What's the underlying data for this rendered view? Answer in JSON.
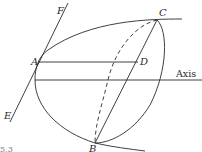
{
  "figure": {
    "caption_fragment": "5.3",
    "labels": {
      "A": "A",
      "B": "B",
      "C": "C",
      "D": "D",
      "E": "E",
      "F": "F",
      "axis": "Axis"
    },
    "elements": [
      {
        "id": "tangent-line",
        "from": "E",
        "to": "F"
      },
      {
        "id": "chord-AD",
        "from": "A",
        "to": "D"
      },
      {
        "id": "chord-BC",
        "from": "B",
        "to": "C"
      },
      {
        "id": "axis-line",
        "label": "Axis"
      },
      {
        "id": "parabola-curve",
        "through": [
          "C",
          "A",
          "B"
        ]
      },
      {
        "id": "ellipse-front",
        "style": "solid",
        "from": "C",
        "to": "B"
      },
      {
        "id": "ellipse-back",
        "style": "dashed",
        "from": "C",
        "to": "B"
      }
    ]
  }
}
